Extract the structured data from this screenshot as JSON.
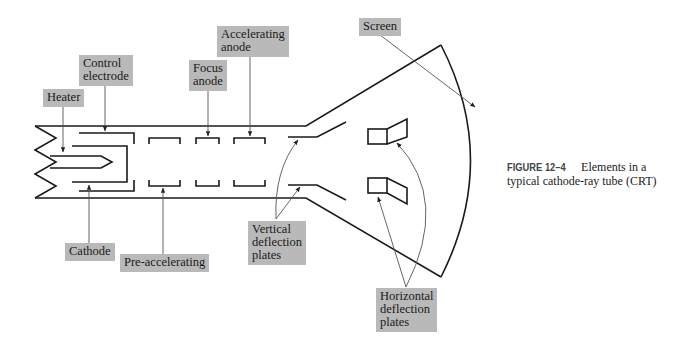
{
  "figure": {
    "number": "FIGURE 12–4",
    "caption": "Elements in a typical cathode-ray tube (CRT)",
    "caption_line1": "Elements in a",
    "caption_line2": "typical cathode-ray tube (CRT)"
  },
  "labels": {
    "heater": "Heater",
    "control_electrode": "Control\nelectrode",
    "focus_anode": "Focus\nanode",
    "accelerating_anode": "Accelerating\nanode",
    "screen": "Screen",
    "cathode": "Cathode",
    "pre_accelerating": "Pre-accelerating",
    "vertical_deflection_plates": "Vertical\ndeflection\nplates",
    "horizontal_deflection_plates": "Horizontal\ndeflection\nplates"
  },
  "colors": {
    "label_background": "#b9b9b9",
    "line": "#1a1a1a",
    "leader": "#444444"
  }
}
